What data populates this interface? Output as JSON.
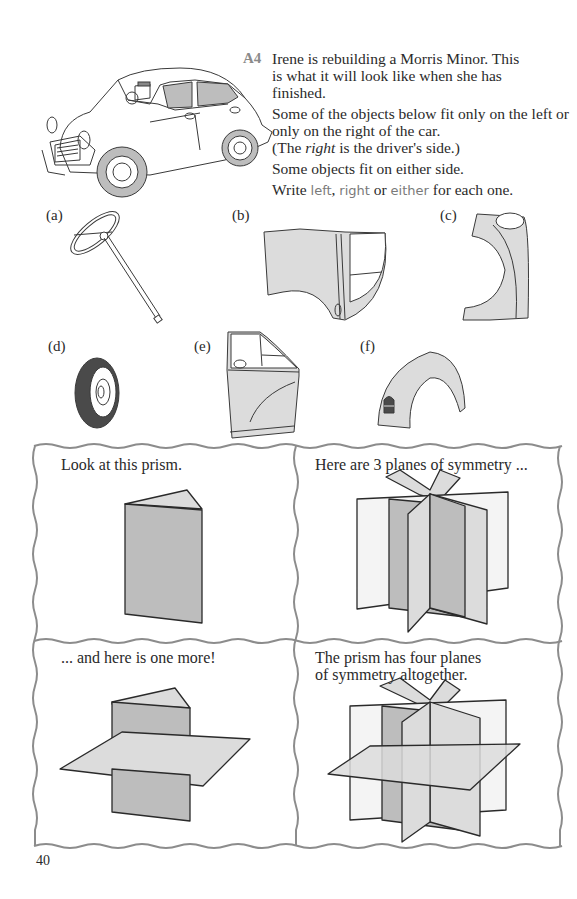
{
  "question": {
    "number": "A4",
    "paragraphs": [
      "Irene is rebuilding a Morris Minor. This is what it will look like when she has finished.",
      "Some of the objects below fit only on the left or only on the right of the car.",
      "Some objects fit on either side."
    ],
    "driver_note_prefix": "(The ",
    "driver_note_italic": "right",
    "driver_note_suffix": " is the driver's side.)",
    "instruction_prefix": "Write ",
    "instruction_words": [
      "left",
      "right",
      "either"
    ],
    "instruction_sep1": ", ",
    "instruction_sep2": " or ",
    "instruction_suffix": " for each one."
  },
  "items": [
    {
      "label": "(a)",
      "object": "steering wheel"
    },
    {
      "label": "(b)",
      "object": "front wing panel"
    },
    {
      "label": "(c)",
      "object": "rear wing"
    },
    {
      "label": "(d)",
      "object": "tyre"
    },
    {
      "label": "(e)",
      "object": "door"
    },
    {
      "label": "(f)",
      "object": "wheel arch"
    }
  ],
  "panels": [
    {
      "text": "Look at this prism."
    },
    {
      "text": "Here are 3 planes of symmetry ..."
    },
    {
      "text": "... and here is one more!"
    },
    {
      "text_line1": "The prism has four planes",
      "text_line2": "of symmetry altogether."
    }
  ],
  "page_number": "40",
  "colors": {
    "ink": "#2a2a2a",
    "fill_light": "#dcdcdc",
    "fill_mid": "#bdbdbd",
    "fill_dark": "#4a4a4a",
    "border": "#8c8c8c"
  }
}
